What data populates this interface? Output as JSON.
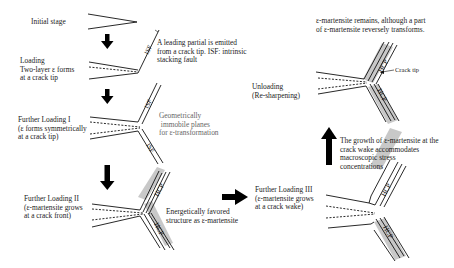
{
  "diagram": {
    "stages": [
      {
        "id": "initial",
        "label": "Initial stage"
      },
      {
        "id": "loading",
        "label": "Loading\nTwo-layer ε forms\nat a crack tip"
      },
      {
        "id": "further_1",
        "label": "Further Loading I\n(ε forms symmetrically\nat a crack tip)"
      },
      {
        "id": "further_2",
        "label": "Further Loading II\n(ε-martensite grows\nat a crack front)"
      },
      {
        "id": "further_3",
        "label": "Further Loading III\n(ε-martensite grows\nat a crack wake)"
      },
      {
        "id": "unloading",
        "label": "Unloading\n(Re-sharpening)"
      }
    ],
    "notes": {
      "leading_partial": "A leading partial is emitted\nfrom a crack tip. ISF: intrinsic\nstacking fault",
      "immobile_planes": "Geometrically\n immobile planes\nfor ε-transformation",
      "energetically": "Energetically favored\nstructure as ε-martensite",
      "wake_growth": "The growth of ε-martensite at the\ncrack wake accommodates\nmacroscopic stress\nconcentrations",
      "remains": "ε-martensite remains, although a part\nof ε-martensite reversely transforms.",
      "crack_tip": "Crack tip"
    },
    "band_labels": {
      "isf": "ISF",
      "hcp": "HCP"
    },
    "arrows": [
      {
        "from": "initial",
        "to": "loading",
        "direction": "down"
      },
      {
        "from": "loading",
        "to": "further_1",
        "direction": "down"
      },
      {
        "from": "further_1",
        "to": "further_2",
        "direction": "down"
      },
      {
        "from": "further_2",
        "to": "further_3",
        "direction": "right"
      },
      {
        "from": "further_3",
        "to": "unloading",
        "direction": "up"
      }
    ],
    "colors": {
      "line": "#111111",
      "hcp_band": "#c8c8c8",
      "arrow": "#000000",
      "gray_text": "#666666"
    }
  }
}
